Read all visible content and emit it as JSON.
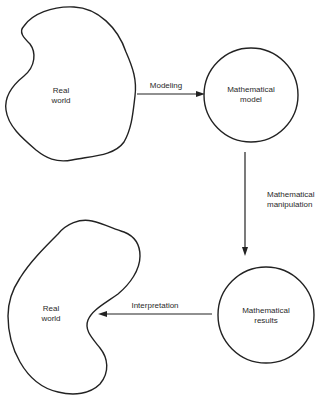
{
  "diagram": {
    "type": "flow-cycle",
    "nodes": [
      {
        "id": "real-world-top",
        "shape": "blob",
        "lines": [
          "Real",
          "world"
        ]
      },
      {
        "id": "mathematical-model",
        "shape": "circle",
        "lines": [
          "Mathematical",
          "model"
        ]
      },
      {
        "id": "mathematical-results",
        "shape": "circle",
        "lines": [
          "Mathematical",
          "results"
        ]
      },
      {
        "id": "real-world-bottom",
        "shape": "blob",
        "lines": [
          "Real",
          "world"
        ]
      }
    ],
    "edges": [
      {
        "id": "modeling",
        "from": "real-world-top",
        "to": "mathematical-model",
        "lines": [
          "Modeling"
        ]
      },
      {
        "id": "manipulation",
        "from": "mathematical-model",
        "to": "mathematical-results",
        "lines": [
          "Mathematical",
          "manipulation"
        ]
      },
      {
        "id": "interpretation",
        "from": "mathematical-results",
        "to": "real-world-bottom",
        "lines": [
          "Interpretation"
        ]
      }
    ]
  },
  "colors": {
    "stroke": "#222222",
    "text": "#2a2a2a",
    "background": "#ffffff"
  }
}
